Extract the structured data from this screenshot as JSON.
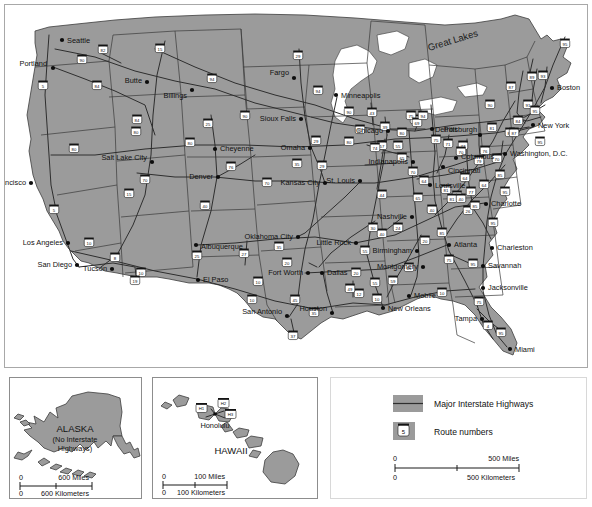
{
  "map": {
    "title": "United States Major Interstate Highways",
    "region_labels": [
      {
        "name": "great-lakes",
        "text": "Great Lakes",
        "x": 424,
        "y": 46,
        "rot": -17,
        "size": 9.5
      }
    ],
    "cities": [
      {
        "name": "seattle",
        "label": "Seattle",
        "x": 57,
        "y": 35,
        "dx": 5,
        "dy": 3,
        "anchor": "start"
      },
      {
        "name": "portland",
        "label": "Portland",
        "x": 48,
        "y": 63,
        "dx": -6,
        "dy": -2,
        "anchor": "end"
      },
      {
        "name": "butte",
        "label": "Butte",
        "x": 142,
        "y": 77,
        "dx": -5,
        "dy": 1,
        "anchor": "end"
      },
      {
        "name": "billings",
        "label": "Billings",
        "x": 187,
        "y": 85,
        "dx": -5,
        "dy": 8,
        "anchor": "end"
      },
      {
        "name": "fargo",
        "label": "Fargo",
        "x": 289,
        "y": 73,
        "dx": -5,
        "dy": -3,
        "anchor": "end"
      },
      {
        "name": "minneapolis",
        "label": "Minneapolis",
        "x": 331,
        "y": 90,
        "dx": 5,
        "dy": 3,
        "anchor": "start"
      },
      {
        "name": "sioux-falls",
        "label": "Sioux Falls",
        "x": 296,
        "y": 114,
        "dx": -5,
        "dy": 2,
        "anchor": "end"
      },
      {
        "name": "salt-lake-city",
        "label": "Salt Lake City",
        "x": 147,
        "y": 157,
        "dx": -5,
        "dy": -2,
        "anchor": "end"
      },
      {
        "name": "cheyenne",
        "label": "Cheyenne",
        "x": 210,
        "y": 144,
        "dx": 5,
        "dy": 2,
        "anchor": "start"
      },
      {
        "name": "denver",
        "label": "Denver",
        "x": 213,
        "y": 172,
        "dx": -5,
        "dy": 2,
        "anchor": "end"
      },
      {
        "name": "omaha",
        "label": "Omaha",
        "x": 305,
        "y": 143,
        "dx": -5,
        "dy": 2,
        "anchor": "end"
      },
      {
        "name": "kansas-city",
        "label": "Kansas City",
        "x": 320,
        "y": 178,
        "dx": -5,
        "dy": 2,
        "anchor": "end"
      },
      {
        "name": "st-louis",
        "label": "St. Louis",
        "x": 355,
        "y": 176,
        "dx": -5,
        "dy": 2,
        "anchor": "end"
      },
      {
        "name": "chicago",
        "label": "Chicago",
        "x": 383,
        "y": 126,
        "dx": -5,
        "dy": 2,
        "anchor": "end"
      },
      {
        "name": "detroit",
        "label": "Detroit",
        "x": 427,
        "y": 124,
        "dx": 3,
        "dy": 3,
        "anchor": "start"
      },
      {
        "name": "indianapolis",
        "label": "Indianapolis",
        "x": 408,
        "y": 157,
        "dx": -5,
        "dy": 2,
        "anchor": "end"
      },
      {
        "name": "cincinnati",
        "label": "Cincinnati",
        "x": 438,
        "y": 162,
        "dx": 5,
        "dy": 6,
        "anchor": "start"
      },
      {
        "name": "columbus",
        "label": "Columbus",
        "x": 451,
        "y": 153,
        "dx": 5,
        "dy": 1,
        "anchor": "start"
      },
      {
        "name": "louisville",
        "label": "Louisville",
        "x": 425,
        "y": 180,
        "dx": 5,
        "dy": 3,
        "anchor": "start"
      },
      {
        "name": "pittsburgh",
        "label": "Pittsburgh",
        "x": 475,
        "y": 130,
        "dx": -3,
        "dy": -3,
        "anchor": "end"
      },
      {
        "name": "new-york",
        "label": "New York",
        "x": 528,
        "y": 120,
        "dx": 5,
        "dy": 3,
        "anchor": "start"
      },
      {
        "name": "boston",
        "label": "Boston",
        "x": 547,
        "y": 83,
        "dx": 5,
        "dy": 2,
        "anchor": "start"
      },
      {
        "name": "washington-dc",
        "label": "Washington, D.C.",
        "x": 500,
        "y": 149,
        "dx": 5,
        "dy": 2,
        "anchor": "start"
      },
      {
        "name": "charlotte",
        "label": "Charlotte",
        "x": 481,
        "y": 199,
        "dx": 5,
        "dy": 2,
        "anchor": "start"
      },
      {
        "name": "charleston",
        "label": "Charleston",
        "x": 487,
        "y": 243,
        "dx": 5,
        "dy": 2,
        "anchor": "start"
      },
      {
        "name": "savannah",
        "label": "Savannah",
        "x": 478,
        "y": 261,
        "dx": 5,
        "dy": 2,
        "anchor": "start"
      },
      {
        "name": "jacksonville",
        "label": "Jacksonville",
        "x": 478,
        "y": 283,
        "dx": 5,
        "dy": 2,
        "anchor": "start"
      },
      {
        "name": "tampa",
        "label": "Tampa",
        "x": 477,
        "y": 314,
        "dx": -5,
        "dy": 2,
        "anchor": "end"
      },
      {
        "name": "miami",
        "label": "Miami",
        "x": 505,
        "y": 344,
        "dx": 5,
        "dy": 3,
        "anchor": "start"
      },
      {
        "name": "atlanta",
        "label": "Atlanta",
        "x": 444,
        "y": 240,
        "dx": 5,
        "dy": 2,
        "anchor": "start"
      },
      {
        "name": "nashville",
        "label": "Nashville",
        "x": 407,
        "y": 212,
        "dx": -5,
        "dy": 2,
        "anchor": "end"
      },
      {
        "name": "birmingham",
        "label": "Birmingham",
        "x": 412,
        "y": 246,
        "dx": -5,
        "dy": 2,
        "anchor": "end"
      },
      {
        "name": "montgomery",
        "label": "Montgomery",
        "x": 418,
        "y": 262,
        "dx": -5,
        "dy": 2,
        "anchor": "end"
      },
      {
        "name": "mobile",
        "label": "Mobile",
        "x": 404,
        "y": 291,
        "dx": 5,
        "dy": 2,
        "anchor": "start"
      },
      {
        "name": "new-orleans",
        "label": "New Orleans",
        "x": 378,
        "y": 303,
        "dx": 5,
        "dy": 3,
        "anchor": "start"
      },
      {
        "name": "little-rock",
        "label": "Little Rock",
        "x": 351,
        "y": 238,
        "dx": -5,
        "dy": 2,
        "anchor": "end"
      },
      {
        "name": "dallas",
        "label": "Dallas",
        "x": 317,
        "y": 268,
        "dx": 5,
        "dy": 2,
        "anchor": "start"
      },
      {
        "name": "fort-worth",
        "label": "Fort Worth",
        "x": 303,
        "y": 268,
        "dx": -5,
        "dy": 2,
        "anchor": "end"
      },
      {
        "name": "houston",
        "label": "Houston",
        "x": 327,
        "y": 308,
        "dx": -5,
        "dy": -2,
        "anchor": "end"
      },
      {
        "name": "san-antonio",
        "label": "San Antonio",
        "x": 282,
        "y": 311,
        "dx": -5,
        "dy": -2,
        "anchor": "end"
      },
      {
        "name": "oklahoma-city",
        "label": "Oklahoma City",
        "x": 293,
        "y": 232,
        "dx": -5,
        "dy": 2,
        "anchor": "end"
      },
      {
        "name": "albuquerque",
        "label": "Albuquerque",
        "x": 191,
        "y": 240,
        "dx": 5,
        "dy": 4,
        "anchor": "start"
      },
      {
        "name": "el-paso",
        "label": "El Paso",
        "x": 193,
        "y": 275,
        "dx": 5,
        "dy": 2,
        "anchor": "start"
      },
      {
        "name": "tucson",
        "label": "Tucson",
        "x": 107,
        "y": 264,
        "dx": -5,
        "dy": 2,
        "anchor": "end"
      },
      {
        "name": "san-diego",
        "label": "San Diego",
        "x": 72,
        "y": 260,
        "dx": -5,
        "dy": 2,
        "anchor": "end"
      },
      {
        "name": "los-angeles",
        "label": "Los Angeles",
        "x": 63,
        "y": 238,
        "dx": -5,
        "dy": 2,
        "anchor": "end"
      },
      {
        "name": "san-francisco",
        "label": "San Francisco",
        "x": 26,
        "y": 178,
        "dx": -5,
        "dy": 2,
        "anchor": "end"
      }
    ],
    "route_shields": [
      {
        "num": "5",
        "x": 38,
        "y": 80
      },
      {
        "num": "90",
        "x": 77,
        "y": 54
      },
      {
        "num": "82",
        "x": 98,
        "y": 44
      },
      {
        "num": "15",
        "x": 155,
        "y": 43
      },
      {
        "num": "84",
        "x": 92,
        "y": 80
      },
      {
        "num": "94",
        "x": 207,
        "y": 73
      },
      {
        "num": "90",
        "x": 240,
        "y": 110
      },
      {
        "num": "25",
        "x": 203,
        "y": 118
      },
      {
        "num": "80",
        "x": 185,
        "y": 137
      },
      {
        "num": "84",
        "x": 132,
        "y": 114
      },
      {
        "num": "80",
        "x": 131,
        "y": 126
      },
      {
        "num": "76",
        "x": 226,
        "y": 161
      },
      {
        "num": "70",
        "x": 140,
        "y": 174
      },
      {
        "num": "15",
        "x": 124,
        "y": 188
      },
      {
        "num": "80",
        "x": 69,
        "y": 143
      },
      {
        "num": "5",
        "x": 49,
        "y": 204
      },
      {
        "num": "10",
        "x": 84,
        "y": 237
      },
      {
        "num": "8",
        "x": 110,
        "y": 252
      },
      {
        "num": "10",
        "x": 136,
        "y": 267
      },
      {
        "num": "19",
        "x": 130,
        "y": 275
      },
      {
        "num": "29",
        "x": 293,
        "y": 50
      },
      {
        "num": "94",
        "x": 313,
        "y": 85
      },
      {
        "num": "90",
        "x": 344,
        "y": 106
      },
      {
        "num": "35",
        "x": 410,
        "y": 114
      },
      {
        "num": "29",
        "x": 311,
        "y": 135
      },
      {
        "num": "80",
        "x": 344,
        "y": 136
      },
      {
        "num": "35",
        "x": 292,
        "y": 158
      },
      {
        "num": "29",
        "x": 317,
        "y": 160
      },
      {
        "num": "70",
        "x": 262,
        "y": 177
      },
      {
        "num": "44",
        "x": 377,
        "y": 189
      },
      {
        "num": "40",
        "x": 377,
        "y": 228
      },
      {
        "num": "40",
        "x": 200,
        "y": 200
      },
      {
        "num": "25",
        "x": 192,
        "y": 250
      },
      {
        "num": "27",
        "x": 239,
        "y": 248
      },
      {
        "num": "10",
        "x": 253,
        "y": 276
      },
      {
        "num": "35",
        "x": 274,
        "y": 241
      },
      {
        "num": "20",
        "x": 282,
        "y": 257
      },
      {
        "num": "10",
        "x": 247,
        "y": 294
      },
      {
        "num": "45",
        "x": 290,
        "y": 294
      },
      {
        "num": "35",
        "x": 309,
        "y": 307
      },
      {
        "num": "37",
        "x": 288,
        "y": 330
      },
      {
        "num": "30",
        "x": 368,
        "y": 222
      },
      {
        "num": "55",
        "x": 360,
        "y": 245
      },
      {
        "num": "20",
        "x": 351,
        "y": 267
      },
      {
        "num": "55",
        "x": 370,
        "y": 277
      },
      {
        "num": "10",
        "x": 372,
        "y": 293
      },
      {
        "num": "12",
        "x": 354,
        "y": 288
      },
      {
        "num": "49",
        "x": 345,
        "y": 283
      },
      {
        "num": "59",
        "x": 388,
        "y": 275
      },
      {
        "num": "65",
        "x": 404,
        "y": 262
      },
      {
        "num": "20",
        "x": 420,
        "y": 235
      },
      {
        "num": "85",
        "x": 437,
        "y": 227
      },
      {
        "num": "75",
        "x": 444,
        "y": 254
      },
      {
        "num": "95",
        "x": 468,
        "y": 258
      },
      {
        "num": "10",
        "x": 437,
        "y": 287
      },
      {
        "num": "75",
        "x": 474,
        "y": 296
      },
      {
        "num": "4",
        "x": 483,
        "y": 320
      },
      {
        "num": "95",
        "x": 496,
        "y": 327
      },
      {
        "num": "24",
        "x": 393,
        "y": 222
      },
      {
        "num": "40",
        "x": 427,
        "y": 204
      },
      {
        "num": "26",
        "x": 463,
        "y": 205
      },
      {
        "num": "95",
        "x": 488,
        "y": 217
      },
      {
        "num": "85",
        "x": 452,
        "y": 190
      },
      {
        "num": "77",
        "x": 466,
        "y": 186
      },
      {
        "num": "81",
        "x": 447,
        "y": 193
      },
      {
        "num": "64",
        "x": 460,
        "y": 172
      },
      {
        "num": "75",
        "x": 406,
        "y": 110
      },
      {
        "num": "69",
        "x": 412,
        "y": 117
      },
      {
        "num": "94",
        "x": 418,
        "y": 110
      },
      {
        "num": "43",
        "x": 367,
        "y": 107
      },
      {
        "num": "39",
        "x": 380,
        "y": 121
      },
      {
        "num": "80",
        "x": 397,
        "y": 127
      },
      {
        "num": "90",
        "x": 355,
        "y": 124
      },
      {
        "num": "57",
        "x": 377,
        "y": 140
      },
      {
        "num": "55",
        "x": 393,
        "y": 140
      },
      {
        "num": "74",
        "x": 370,
        "y": 142
      },
      {
        "num": "65",
        "x": 397,
        "y": 152
      },
      {
        "num": "70",
        "x": 408,
        "y": 166
      },
      {
        "num": "64",
        "x": 419,
        "y": 175
      },
      {
        "num": "75",
        "x": 431,
        "y": 134
      },
      {
        "num": "71",
        "x": 443,
        "y": 138
      },
      {
        "num": "77",
        "x": 458,
        "y": 140
      },
      {
        "num": "70",
        "x": 456,
        "y": 146
      },
      {
        "num": "79",
        "x": 474,
        "y": 155
      },
      {
        "num": "76",
        "x": 480,
        "y": 145
      },
      {
        "num": "80",
        "x": 505,
        "y": 127
      },
      {
        "num": "81",
        "x": 487,
        "y": 122
      },
      {
        "num": "90",
        "x": 485,
        "y": 99
      },
      {
        "num": "87",
        "x": 509,
        "y": 127
      },
      {
        "num": "95",
        "x": 535,
        "y": 136
      },
      {
        "num": "84",
        "x": 513,
        "y": 115
      },
      {
        "num": "91",
        "x": 523,
        "y": 99
      },
      {
        "num": "95",
        "x": 530,
        "y": 105
      },
      {
        "num": "89",
        "x": 527,
        "y": 71
      },
      {
        "num": "93",
        "x": 538,
        "y": 70
      },
      {
        "num": "87",
        "x": 506,
        "y": 81
      },
      {
        "num": "95",
        "x": 560,
        "y": 38
      },
      {
        "num": "70",
        "x": 492,
        "y": 153
      },
      {
        "num": "85",
        "x": 495,
        "y": 169
      },
      {
        "num": "64",
        "x": 479,
        "y": 179
      },
      {
        "num": "81",
        "x": 441,
        "y": 184
      },
      {
        "num": "65",
        "x": 413,
        "y": 192
      },
      {
        "num": "40",
        "x": 456,
        "y": 193
      },
      {
        "num": "85",
        "x": 470,
        "y": 200
      },
      {
        "num": "95",
        "x": 500,
        "y": 186
      }
    ]
  },
  "alaska": {
    "name_line1": "ALASKA",
    "name_line2": "(No Interstate",
    "name_line3": "Highways)",
    "scale_zero_top": "0",
    "scale_top": "600 Miles",
    "scale_zero_bottom": "0",
    "scale_bottom": "600 Kilometers"
  },
  "hawaii": {
    "name": "HAWAII",
    "capital": "Honolulu",
    "routes": [
      "H1",
      "H2",
      "H3"
    ],
    "scale_zero_top": "0",
    "scale_top": "100 Miles",
    "scale_zero_bottom": "0",
    "scale_bottom": "100 Kilometers"
  },
  "legend": {
    "highways_label": "Major Interstate Highways",
    "routes_label": "Route numbers",
    "route_sample_num": "5",
    "scale_zero_top": "0",
    "scale_top": "500 Miles",
    "scale_zero_bottom": "0",
    "scale_bottom": "500 Kilometers"
  },
  "colors": {
    "land": "#9b9b9b",
    "water": "#ffffff",
    "highway": "#2e2e2e",
    "border": "#3a3a3a",
    "text": "#111111"
  }
}
